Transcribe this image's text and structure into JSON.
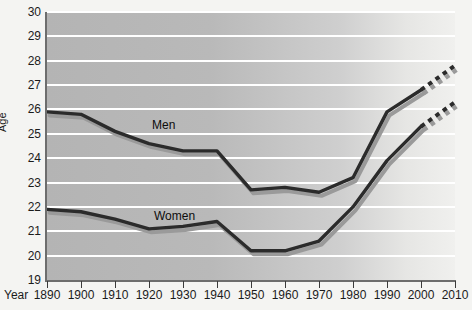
{
  "chart_data": {
    "type": "line",
    "title": "",
    "xlabel": "Year",
    "ylabel": "Age",
    "xlim": [
      1890,
      2010
    ],
    "ylim": [
      19,
      30
    ],
    "grid": true,
    "legend_position": "inline-annotation",
    "x": [
      1890,
      1900,
      1910,
      1920,
      1930,
      1940,
      1950,
      1960,
      1970,
      1980,
      1990,
      2000,
      2010
    ],
    "xtick_labels": [
      "1890",
      "1900",
      "1910",
      "1920",
      "1930",
      "1940",
      "1950",
      "1960",
      "1970",
      "1980",
      "1990",
      "2000",
      "2010"
    ],
    "ytick_labels": [
      "19",
      "20",
      "21",
      "22",
      "23",
      "24",
      "25",
      "26",
      "27",
      "28",
      "29",
      "30"
    ],
    "ytick_values": [
      19,
      20,
      21,
      22,
      23,
      24,
      25,
      26,
      27,
      28,
      29,
      30
    ],
    "series": [
      {
        "name": "Men",
        "label": "Men",
        "color": "#2b2b2b",
        "shadow_color": "#9a9a9a",
        "solid_through": 2000,
        "projection_from": 2000,
        "values": [
          25.9,
          25.8,
          25.1,
          24.6,
          24.3,
          24.3,
          22.7,
          22.8,
          22.6,
          23.2,
          25.9,
          26.8,
          27.8
        ]
      },
      {
        "name": "Women",
        "label": "Women",
        "color": "#2b2b2b",
        "shadow_color": "#9a9a9a",
        "solid_through": 2000,
        "projection_from": 2000,
        "values": [
          21.9,
          21.8,
          21.5,
          21.1,
          21.2,
          21.4,
          20.2,
          20.2,
          20.6,
          22.0,
          23.9,
          25.3,
          26.3
        ]
      }
    ],
    "annotations": [
      {
        "text": "Men",
        "x": 1913,
        "y": 25.45
      },
      {
        "text": "Women",
        "x": 1913,
        "y": 21.75
      }
    ]
  },
  "colors": {
    "page_background": "#f4f4f2",
    "plot_background": "#b9b9b9",
    "gridline": "#ffffff",
    "axis": "#6d6d6d",
    "line": "#2b2b2b",
    "line_shadow": "#9a9a9a",
    "text": "#1b1b1b"
  }
}
